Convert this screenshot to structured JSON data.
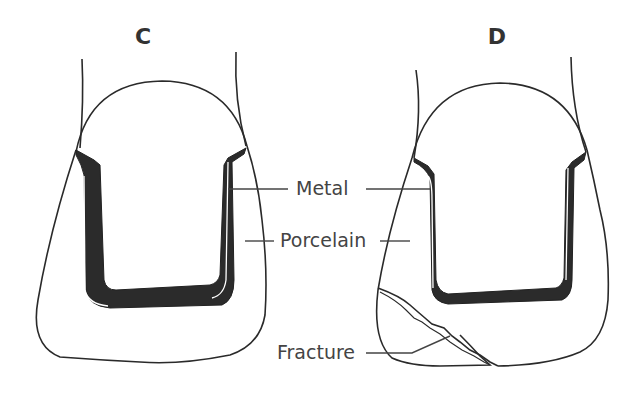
{
  "panels": [
    {
      "id": "C",
      "label": "C"
    },
    {
      "id": "D",
      "label": "D"
    }
  ],
  "labels": {
    "metal": "Metal",
    "porcelain": "Porcelain",
    "fracture": "Fracture"
  },
  "colors": {
    "background": "#ffffff",
    "outline": "#2a2a2a",
    "metal_fill": "#2b2b2b",
    "label_text": "#444444"
  }
}
